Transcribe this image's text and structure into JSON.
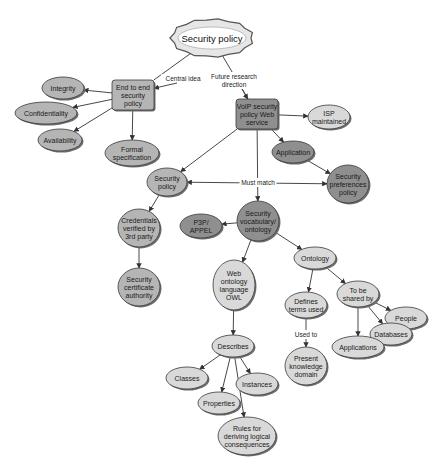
{
  "title": "Security policy",
  "colors": {
    "light": "#d9d9d9",
    "mid": "#b5b5b5",
    "dark": "#8f8f8f",
    "stroke": "#3a3a3a",
    "edge": "#333333",
    "shadow": "#6e6e6e"
  },
  "nodes": [
    {
      "id": "root",
      "shape": "cloud",
      "lines": [
        "Security policy"
      ]
    },
    {
      "id": "e2e",
      "shape": "rect",
      "tone": "mid",
      "lines": [
        "End to end",
        "security",
        "policy"
      ]
    },
    {
      "id": "integrity",
      "shape": "ellipse",
      "tone": "mid",
      "lines": [
        "Integrity"
      ]
    },
    {
      "id": "confidentiality",
      "shape": "ellipse",
      "tone": "mid",
      "lines": [
        "Confidentiality"
      ]
    },
    {
      "id": "availability",
      "shape": "ellipse",
      "tone": "mid",
      "lines": [
        "Availability"
      ]
    },
    {
      "id": "formal",
      "shape": "ellipse",
      "tone": "mid",
      "lines": [
        "Formal",
        "specification"
      ]
    },
    {
      "id": "voip",
      "shape": "rect",
      "tone": "dark",
      "lines": [
        "VoIP security",
        "policy Web",
        "service"
      ]
    },
    {
      "id": "isp",
      "shape": "ellipse",
      "tone": "light",
      "lines": [
        "ISP",
        "maintained"
      ]
    },
    {
      "id": "application",
      "shape": "ellipse",
      "tone": "dark",
      "lines": [
        "Application"
      ]
    },
    {
      "id": "secpref",
      "shape": "ellipse",
      "tone": "dark",
      "lines": [
        "Security",
        "preferences",
        "policy"
      ]
    },
    {
      "id": "secpolicy",
      "shape": "ellipse",
      "tone": "mid",
      "lines": [
        "Security",
        "policy"
      ]
    },
    {
      "id": "credentials",
      "shape": "ellipse",
      "tone": "mid",
      "lines": [
        "Credentials",
        "verified by",
        "3rd party"
      ]
    },
    {
      "id": "certauth",
      "shape": "ellipse",
      "tone": "mid",
      "lines": [
        "Security",
        "certificate",
        "authority"
      ]
    },
    {
      "id": "p3p",
      "shape": "ellipse",
      "tone": "dark",
      "lines": [
        "P3P/",
        "APPEL"
      ]
    },
    {
      "id": "vocab",
      "shape": "ellipse",
      "tone": "dark",
      "lines": [
        "Security",
        "vocabulary/",
        "ontology"
      ]
    },
    {
      "id": "owl",
      "shape": "ellipse",
      "tone": "light",
      "lines": [
        "Web",
        "ontology",
        "language",
        "OWL"
      ]
    },
    {
      "id": "ontology",
      "shape": "ellipse",
      "tone": "light",
      "lines": [
        "Ontology"
      ]
    },
    {
      "id": "defines",
      "shape": "ellipse",
      "tone": "light",
      "lines": [
        "Defines",
        "terms used"
      ]
    },
    {
      "id": "present",
      "shape": "ellipse",
      "tone": "light",
      "lines": [
        "Present",
        "knowledge",
        "domain"
      ]
    },
    {
      "id": "shared",
      "shape": "ellipse",
      "tone": "light",
      "lines": [
        "To be",
        "shared by"
      ]
    },
    {
      "id": "people",
      "shape": "ellipse",
      "tone": "light",
      "lines": [
        "People"
      ]
    },
    {
      "id": "databases",
      "shape": "ellipse",
      "tone": "light",
      "lines": [
        "Databases"
      ]
    },
    {
      "id": "applications",
      "shape": "ellipse",
      "tone": "light",
      "lines": [
        "Applications"
      ]
    },
    {
      "id": "describes",
      "shape": "ellipse",
      "tone": "light",
      "lines": [
        "Describes"
      ]
    },
    {
      "id": "classes",
      "shape": "ellipse",
      "tone": "light",
      "lines": [
        "Classes"
      ]
    },
    {
      "id": "properties",
      "shape": "ellipse",
      "tone": "light",
      "lines": [
        "Properties"
      ]
    },
    {
      "id": "instances",
      "shape": "ellipse",
      "tone": "light",
      "lines": [
        "Instances"
      ]
    },
    {
      "id": "rules",
      "shape": "ellipse",
      "tone": "light",
      "lines": [
        "Rules for",
        "deriving logical",
        "consequences"
      ]
    }
  ],
  "edges": [
    {
      "from": "root",
      "to": "e2e",
      "label": [
        "Central idea"
      ]
    },
    {
      "from": "root",
      "to": "voip",
      "label": [
        "Future research",
        "direction"
      ]
    },
    {
      "from": "e2e",
      "to": "integrity"
    },
    {
      "from": "e2e",
      "to": "confidentiality"
    },
    {
      "from": "e2e",
      "to": "availability"
    },
    {
      "from": "e2e",
      "to": "formal"
    },
    {
      "from": "voip",
      "to": "isp"
    },
    {
      "from": "voip",
      "to": "application"
    },
    {
      "from": "application",
      "to": "secpref"
    },
    {
      "from": "voip",
      "to": "secpolicy"
    },
    {
      "from": "voip",
      "to": "vocab"
    },
    {
      "from": "secpolicy",
      "to": "secpref",
      "label": [
        "Must match"
      ],
      "bidirectional": true
    },
    {
      "from": "secpolicy",
      "to": "credentials"
    },
    {
      "from": "credentials",
      "to": "certauth"
    },
    {
      "from": "vocab",
      "to": "p3p"
    },
    {
      "from": "vocab",
      "to": "owl"
    },
    {
      "from": "vocab",
      "to": "ontology"
    },
    {
      "from": "ontology",
      "to": "defines"
    },
    {
      "from": "ontology",
      "to": "shared"
    },
    {
      "from": "defines",
      "to": "present",
      "label": [
        "Used to"
      ]
    },
    {
      "from": "shared",
      "to": "people"
    },
    {
      "from": "shared",
      "to": "databases"
    },
    {
      "from": "shared",
      "to": "applications"
    },
    {
      "from": "owl",
      "to": "describes"
    },
    {
      "from": "describes",
      "to": "classes"
    },
    {
      "from": "describes",
      "to": "properties"
    },
    {
      "from": "describes",
      "to": "instances"
    },
    {
      "from": "describes",
      "to": "rules"
    }
  ]
}
